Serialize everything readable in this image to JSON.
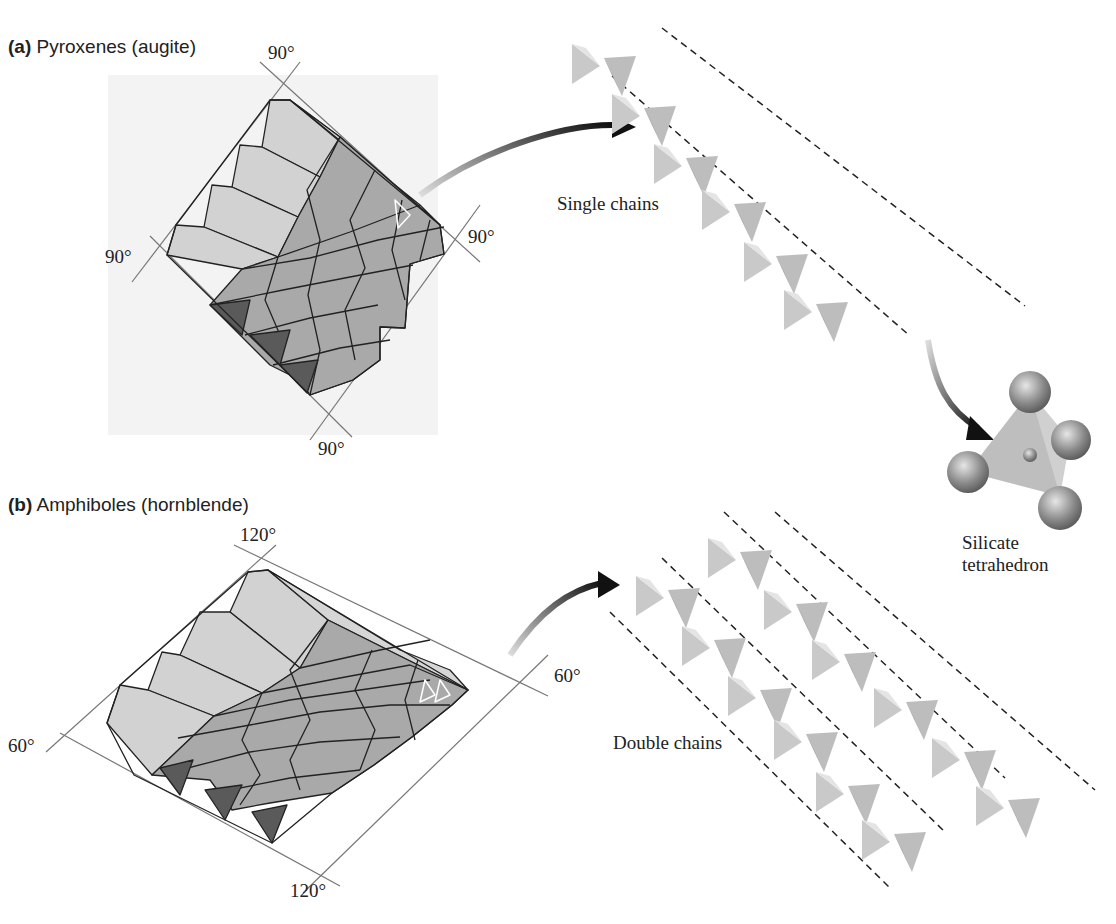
{
  "panel_a": {
    "letter": "(a)",
    "title": "Pyroxenes (augite)",
    "angles": [
      "90°",
      "90°",
      "90°",
      "90°"
    ],
    "chain_label": "Single chains"
  },
  "panel_b": {
    "letter": "(b)",
    "title": "Amphiboles (hornblende)",
    "angles": [
      "120°",
      "60°",
      "60°",
      "120°"
    ],
    "chain_label": "Double chains"
  },
  "tetrahedron": {
    "label_line1": "Silicate",
    "label_line2": "tetrahedron"
  },
  "colors": {
    "light_face": "#d2d2d2",
    "mid_face": "#a8a8a8",
    "dark_face": "#5a5a5a",
    "outline": "#222222",
    "guide_line": "#777777",
    "sphere": "#8c8c8c"
  }
}
